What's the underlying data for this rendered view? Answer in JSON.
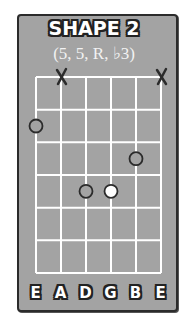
{
  "title": "SHAPE 2",
  "subtitle": "(5, 5, R, ♭3)",
  "colors": {
    "background": "#a3a3a3",
    "grid": "#ffffff",
    "border": "#2b2b2b",
    "note_outline": "#2b2b2b",
    "root_fill": "#ffffff"
  },
  "strings": [
    "E",
    "A",
    "D",
    "G",
    "B",
    "E"
  ],
  "fret_count": 6,
  "muted_strings": [
    2,
    6
  ],
  "notes": [
    {
      "string": 1,
      "fret": 2,
      "type": "interval"
    },
    {
      "string": 5,
      "fret": 3,
      "type": "interval"
    },
    {
      "string": 3,
      "fret": 4,
      "type": "interval"
    },
    {
      "string": 4,
      "fret": 4,
      "type": "root"
    }
  ]
}
